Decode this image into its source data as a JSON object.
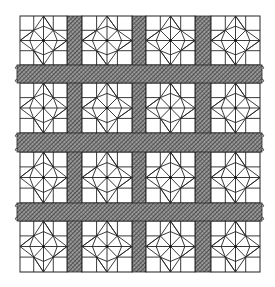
{
  "illustration": {
    "subject": "quilt",
    "block_pattern": "eight-pointed star",
    "grid": {
      "rows": 4,
      "cols": 4
    },
    "colors": {
      "background": "#ffffff",
      "line": "#222222",
      "sashing_fill": "#8a8a8a",
      "hatch_dark": "#2a2a2a"
    }
  }
}
